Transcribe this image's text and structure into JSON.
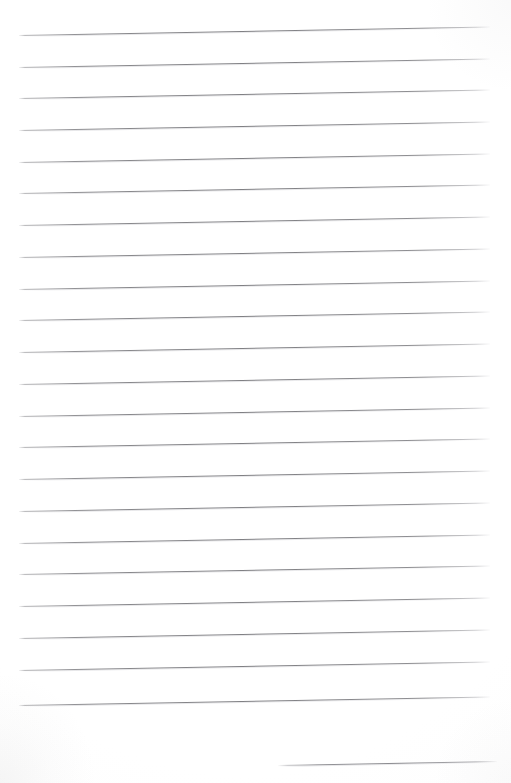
{
  "document": {
    "kind": "scanned-ruled-notebook-page",
    "title": "Blank Ruled Notebook Page",
    "content_text": "",
    "page_width": 511,
    "page_height": 783,
    "background_color": "#ffffff",
    "rule_color": "#7e7e82",
    "rule_thickness_px": 1,
    "rule_spacing_px": 31.8,
    "rule_skew_degrees": -1.02,
    "rule_left_x": 19,
    "rule_right_x": 490,
    "first_rule_y": 35,
    "full_rule_count": 22,
    "partial_rule_count": 1,
    "has_margin_rule": false,
    "has_holes": false,
    "has_handwriting": false,
    "lines": [
      {
        "name": "rule-1",
        "x": 19,
        "y": 35,
        "width": 471
      },
      {
        "name": "rule-2",
        "x": 19,
        "y": 67,
        "width": 471
      },
      {
        "name": "rule-3",
        "x": 19,
        "y": 98,
        "width": 471
      },
      {
        "name": "rule-4",
        "x": 19,
        "y": 130,
        "width": 471
      },
      {
        "name": "rule-5",
        "x": 19,
        "y": 162,
        "width": 471
      },
      {
        "name": "rule-6",
        "x": 19,
        "y": 193,
        "width": 471
      },
      {
        "name": "rule-7",
        "x": 19,
        "y": 225,
        "width": 471
      },
      {
        "name": "rule-8",
        "x": 19,
        "y": 257,
        "width": 471
      },
      {
        "name": "rule-9",
        "x": 19,
        "y": 289,
        "width": 471
      },
      {
        "name": "rule-10",
        "x": 19,
        "y": 320,
        "width": 471
      },
      {
        "name": "rule-11",
        "x": 19,
        "y": 352,
        "width": 471
      },
      {
        "name": "rule-12",
        "x": 19,
        "y": 384,
        "width": 471
      },
      {
        "name": "rule-13",
        "x": 19,
        "y": 416,
        "width": 471
      },
      {
        "name": "rule-14",
        "x": 19,
        "y": 447,
        "width": 471
      },
      {
        "name": "rule-15",
        "x": 19,
        "y": 479,
        "width": 471
      },
      {
        "name": "rule-16",
        "x": 19,
        "y": 511,
        "width": 471
      },
      {
        "name": "rule-17",
        "x": 19,
        "y": 543,
        "width": 471
      },
      {
        "name": "rule-18",
        "x": 19,
        "y": 574,
        "width": 471
      },
      {
        "name": "rule-19",
        "x": 19,
        "y": 606,
        "width": 471
      },
      {
        "name": "rule-20",
        "x": 19,
        "y": 638,
        "width": 471
      },
      {
        "name": "rule-21",
        "x": 19,
        "y": 670,
        "width": 471
      },
      {
        "name": "rule-22",
        "x": 19,
        "y": 705,
        "width": 471
      },
      {
        "name": "rule-23-partial",
        "x": 278,
        "y": 765,
        "width": 219,
        "partial": true
      }
    ]
  }
}
